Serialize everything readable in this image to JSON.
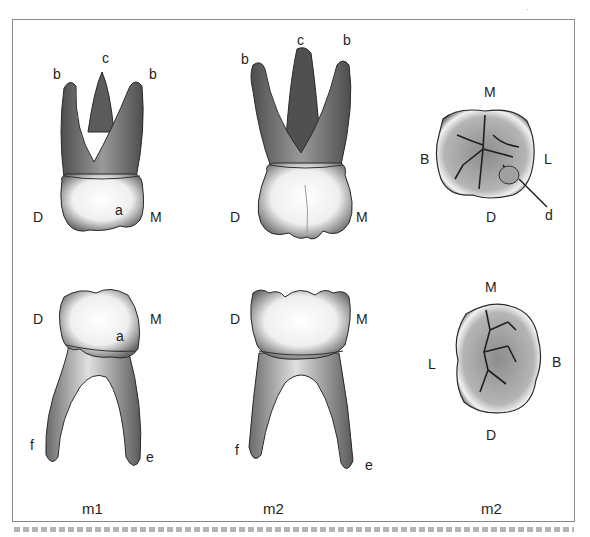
{
  "figure": {
    "panels": [
      {
        "id": "m1-buccal",
        "caption": "m1",
        "labels": {
          "c": "c",
          "b_left": "b",
          "b_right": "b",
          "a": "a",
          "D": "D",
          "M": "M"
        }
      },
      {
        "id": "m2-buccal",
        "caption": "m2",
        "labels": {
          "c": "c",
          "b_left": "b",
          "b_right": "b",
          "D": "D",
          "M": "M"
        }
      },
      {
        "id": "m2-occlusal-upper",
        "labels": {
          "M": "M",
          "B": "B",
          "L": "L",
          "D": "D",
          "d": "d"
        }
      },
      {
        "id": "m1-lower",
        "labels": {
          "D": "D",
          "M": "M",
          "a": "a",
          "f": "f",
          "e": "e"
        }
      },
      {
        "id": "m2-lower",
        "labels": {
          "D": "D",
          "M": "M",
          "f": "f",
          "e": "e"
        }
      },
      {
        "id": "m2-occlusal-lower",
        "caption": "m2",
        "labels": {
          "M": "M",
          "L": "L",
          "B": "B",
          "D": "D"
        }
      }
    ],
    "bottom_captions": [
      "m1",
      "m2",
      "m2"
    ],
    "caption_text": "…"
  },
  "colors": {
    "frame": "#8a8a8a",
    "enamel_light": "#f4f4f4",
    "root_dark": "#5a5a5a",
    "outline": "#2a2a2a"
  }
}
